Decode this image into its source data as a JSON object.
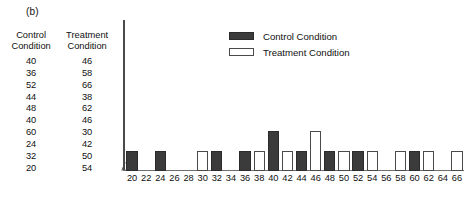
{
  "panel_label": "(b)",
  "data_table": {
    "columns": [
      {
        "name": "control",
        "header_line1": "Control",
        "header_line2": "Condition"
      },
      {
        "name": "treatment",
        "header_line1": "Treatment",
        "header_line2": "Condition"
      }
    ],
    "rows": [
      {
        "control": "40",
        "treatment": "46"
      },
      {
        "control": "36",
        "treatment": "58"
      },
      {
        "control": "52",
        "treatment": "66"
      },
      {
        "control": "44",
        "treatment": "38"
      },
      {
        "control": "48",
        "treatment": "62"
      },
      {
        "control": "40",
        "treatment": "46"
      },
      {
        "control": "60",
        "treatment": "30"
      },
      {
        "control": "24",
        "treatment": "42"
      },
      {
        "control": "32",
        "treatment": "50"
      },
      {
        "control": "20",
        "treatment": "54"
      }
    ]
  },
  "legend": {
    "position": "top-center",
    "entries": [
      {
        "name": "control",
        "label": "Control Condition",
        "color": "#3b3b3b",
        "style": "filled"
      },
      {
        "name": "treatment",
        "label": "Treatment Condition",
        "color": "#ffffff",
        "style": "outlined"
      }
    ]
  },
  "chart_data": {
    "type": "bar",
    "title": "",
    "subtitle": "",
    "xlabel": "",
    "ylabel": "",
    "grid": false,
    "legend_position": "top-center",
    "axis_break": true,
    "xlim": [
      20,
      66
    ],
    "ylim": [
      0,
      3
    ],
    "categories": [
      20,
      22,
      24,
      26,
      28,
      30,
      32,
      34,
      36,
      38,
      40,
      42,
      44,
      46,
      48,
      50,
      52,
      54,
      56,
      58,
      60,
      62,
      64,
      66
    ],
    "tick_labels": [
      "20",
      "22",
      "24",
      "26",
      "28",
      "30",
      "32",
      "34",
      "36",
      "38",
      "40",
      "42",
      "44",
      "46",
      "48",
      "50",
      "52",
      "54",
      "56",
      "58",
      "60",
      "62",
      "64",
      "66"
    ],
    "series": [
      {
        "name": "Control Condition",
        "color": "#3b3b3b",
        "style": "filled",
        "values": [
          1,
          0,
          1,
          0,
          0,
          0,
          1,
          0,
          1,
          0,
          2,
          0,
          1,
          0,
          1,
          0,
          1,
          0,
          0,
          0,
          1,
          0,
          0,
          0
        ]
      },
      {
        "name": "Treatment Condition",
        "color": "#ffffff",
        "style": "outlined",
        "values": [
          0,
          0,
          0,
          0,
          0,
          1,
          0,
          0,
          0,
          1,
          0,
          1,
          0,
          2,
          0,
          1,
          0,
          1,
          0,
          1,
          0,
          1,
          0,
          1
        ]
      }
    ]
  }
}
